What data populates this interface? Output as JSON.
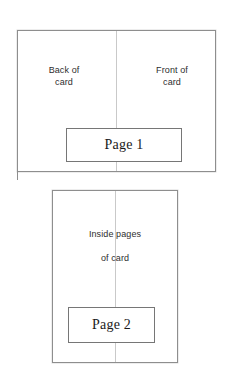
{
  "diagram": {
    "background_color": "#ffffff",
    "line_color": "#8e8e8e",
    "fold_line_color": "#c9c9c9",
    "text_color": "#2e2e2e",
    "panels": [
      {
        "id": "exterior",
        "name": "Card exterior",
        "captions": [
          {
            "id": "back",
            "text": "Back of\ncard",
            "half": "left"
          },
          {
            "id": "front",
            "text": "Front of\ncard",
            "half": "right"
          }
        ],
        "page_box": {
          "label": "Page 1"
        }
      },
      {
        "id": "interior",
        "name": "Card interior",
        "captions": [
          {
            "id": "inside",
            "text": "Inside pages\nof card",
            "half": "center"
          }
        ],
        "page_box": {
          "label": "Page 2"
        }
      }
    ]
  }
}
